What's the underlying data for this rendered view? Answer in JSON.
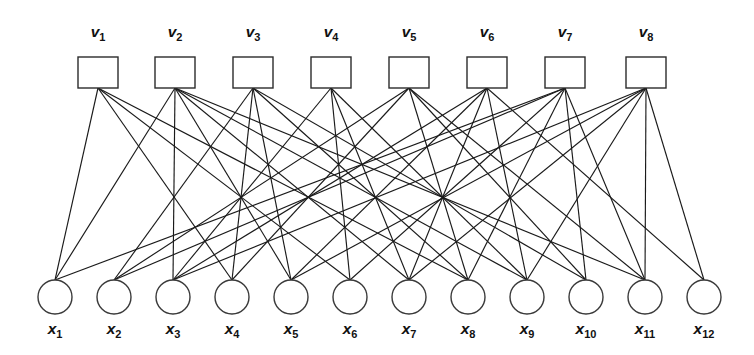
{
  "figure": {
    "kind": "tanner-graph",
    "background_color": "#ffffff",
    "line_color": "#1a1a1a",
    "node_fill": "#ffffff",
    "node_stroke": "#2b2b2b",
    "width": 754,
    "height": 355
  },
  "check_nodes": {
    "symbol": "v",
    "shape": "square",
    "count": 8,
    "labels": [
      "v1",
      "v2",
      "v3",
      "v4",
      "v5",
      "v6",
      "v7",
      "v8"
    ],
    "base": [
      "v",
      "v",
      "v",
      "v",
      "v",
      "v",
      "v",
      "v"
    ],
    "subscripts": [
      "1",
      "2",
      "3",
      "4",
      "5",
      "6",
      "7",
      "8"
    ],
    "box_width": 40,
    "box_height": 31,
    "row_y": 57,
    "centers_x": [
      98,
      175,
      253,
      331,
      409,
      487,
      565,
      646
    ],
    "label_y": 37
  },
  "variable_nodes": {
    "symbol": "x",
    "shape": "circle",
    "count": 12,
    "labels": [
      "x1",
      "x2",
      "x3",
      "x4",
      "x5",
      "x6",
      "x7",
      "x8",
      "x9",
      "x10",
      "x11",
      "x12"
    ],
    "base": [
      "x",
      "x",
      "x",
      "x",
      "x",
      "x",
      "x",
      "x",
      "x",
      "x",
      "x",
      "x"
    ],
    "subscripts": [
      "1",
      "2",
      "3",
      "4",
      "5",
      "6",
      "7",
      "8",
      "9",
      "10",
      "11",
      "12"
    ],
    "radius": 17,
    "row_cy": 297,
    "centers_x": [
      55,
      114,
      173,
      232,
      291,
      350,
      409,
      468,
      527,
      586,
      645,
      704
    ],
    "label_y": 334
  },
  "chart_data": {
    "type": "diagram",
    "check_node_labels": [
      "v1",
      "v2",
      "v3",
      "v4",
      "v5",
      "v6",
      "v7",
      "v8"
    ],
    "variable_node_labels": [
      "x1",
      "x2",
      "x3",
      "x4",
      "x5",
      "x6",
      "x7",
      "x8",
      "x9",
      "x10",
      "x11",
      "x12"
    ],
    "edges": [
      [
        0,
        0
      ],
      [
        0,
        3
      ],
      [
        0,
        5
      ],
      [
        0,
        7
      ],
      [
        1,
        0
      ],
      [
        1,
        2
      ],
      [
        1,
        4
      ],
      [
        1,
        6
      ],
      [
        1,
        8
      ],
      [
        1,
        10
      ],
      [
        2,
        1
      ],
      [
        2,
        3
      ],
      [
        2,
        4
      ],
      [
        2,
        7
      ],
      [
        2,
        9
      ],
      [
        3,
        2
      ],
      [
        3,
        5
      ],
      [
        3,
        6
      ],
      [
        3,
        8
      ],
      [
        4,
        1
      ],
      [
        4,
        3
      ],
      [
        4,
        7
      ],
      [
        4,
        9
      ],
      [
        4,
        10
      ],
      [
        5,
        2
      ],
      [
        5,
        4
      ],
      [
        5,
        6
      ],
      [
        5,
        8
      ],
      [
        5,
        11
      ],
      [
        6,
        0
      ],
      [
        6,
        1
      ],
      [
        6,
        5
      ],
      [
        6,
        7
      ],
      [
        6,
        9
      ],
      [
        6,
        10
      ],
      [
        7,
        2
      ],
      [
        7,
        4
      ],
      [
        7,
        6
      ],
      [
        7,
        8
      ],
      [
        7,
        10
      ],
      [
        7,
        11
      ]
    ],
    "check_degrees": [
      4,
      6,
      5,
      4,
      5,
      5,
      6,
      6
    ],
    "variable_degrees": [
      3,
      3,
      4,
      3,
      4,
      3,
      4,
      4,
      4,
      3,
      4,
      2
    ],
    "edge_count": 41,
    "xlabel": "",
    "ylabel": ""
  }
}
